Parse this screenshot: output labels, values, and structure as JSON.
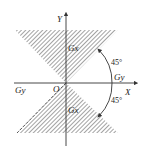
{
  "diagram": {
    "axes": {
      "x_label": "X",
      "y_label": "Y",
      "origin_label": "O"
    },
    "regions": [
      {
        "label": "Gx",
        "position": "upper",
        "fill": "hatched"
      },
      {
        "label": "Gx",
        "position": "lower",
        "fill": "hatched"
      }
    ],
    "boundary_labels": {
      "positive_x": "Gy",
      "negative_x": "Gy"
    },
    "angles": [
      {
        "value": "45°",
        "position": "upper"
      },
      {
        "value": "45°",
        "position": "lower"
      }
    ],
    "colors": {
      "line": "#333333",
      "hatch": "#555555",
      "background": "#ffffff"
    }
  }
}
